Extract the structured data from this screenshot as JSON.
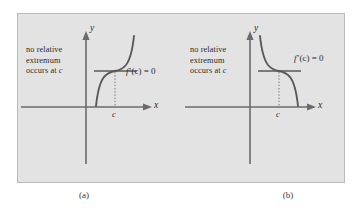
{
  "figure": {
    "background_color": "#e3e3e3",
    "border_color": "#b9b9b9",
    "curve_color": "#595959",
    "axis_color": "#6b6b6b",
    "text_color": "#2b2b2b"
  },
  "panels": [
    {
      "id": "a",
      "caption": "(a)",
      "note_lines": [
        "no relative",
        "extremum",
        "occurs at "
      ],
      "note_italic_tail": "c",
      "derivative_label": {
        "fn": "f",
        "prime": "’",
        "arg": "(c)",
        "equals": " = 0"
      },
      "axis_labels": {
        "y": "y",
        "x": "x"
      },
      "tick_label": "c",
      "curve_type": "increasing-cubic",
      "description": "increasing cubic with horizontal tangent at x = c"
    },
    {
      "id": "b",
      "caption": "(b)",
      "note_lines": [
        "no relative",
        "extremum",
        "occurs at "
      ],
      "note_italic_tail": "c",
      "derivative_label": {
        "fn": "f",
        "prime": "’",
        "arg": "(c)",
        "equals": " = 0"
      },
      "axis_labels": {
        "y": "y",
        "x": "x"
      },
      "tick_label": "c",
      "curve_type": "decreasing-cubic",
      "description": "decreasing cubic with horizontal tangent at x = c"
    }
  ]
}
